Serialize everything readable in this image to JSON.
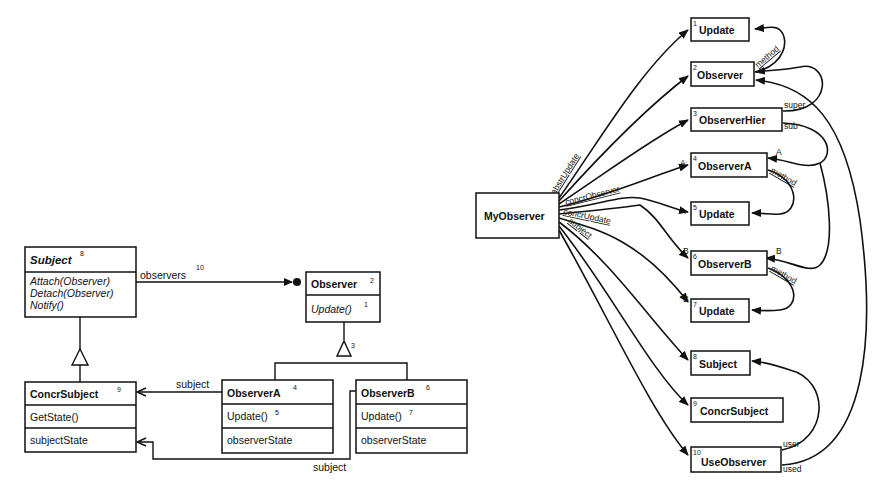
{
  "uml_diagram": {
    "classes": [
      {
        "id": "subject",
        "name": "Subject",
        "number": "8",
        "name_italic": true,
        "methods": [
          "Attach(Observer)",
          "Detach(Observer)",
          "Notify()"
        ],
        "methods_italic": true,
        "attributes": []
      },
      {
        "id": "observer",
        "name": "Observer",
        "number": "2",
        "methods": [
          "Update()"
        ],
        "method_numbers": [
          "1"
        ],
        "methods_italic": true,
        "attributes": []
      },
      {
        "id": "concr_subject",
        "name": "ConcrSubject",
        "number": "9",
        "methods": [
          "GetState()"
        ],
        "attributes": [
          "subjectState"
        ]
      },
      {
        "id": "observer_a",
        "name": "ObserverA",
        "number": "4",
        "methods": [
          "Update()"
        ],
        "method_numbers": [
          "5"
        ],
        "attributes": [
          "observerState"
        ]
      },
      {
        "id": "observer_b",
        "name": "ObserverB",
        "number": "6",
        "methods": [
          "Update()"
        ],
        "method_numbers": [
          "7"
        ],
        "attributes": [
          "observerState"
        ]
      }
    ],
    "associations": [
      {
        "from": "Subject",
        "to": "Observer",
        "label": "observers",
        "number": "10"
      },
      {
        "from": "ObserverA",
        "to": "ConcrSubject",
        "label": "subject"
      },
      {
        "from": "ObserverB",
        "to": "ConcrSubject",
        "label": "subject"
      }
    ],
    "generalizations": [
      {
        "parent": "Subject",
        "children": [
          "ConcrSubject"
        ]
      },
      {
        "parent": "Observer",
        "children": [
          "ObserverA",
          "ObserverB"
        ],
        "number": "3"
      }
    ]
  },
  "role_graph": {
    "root": "MyObserver",
    "nodes": [
      {
        "number": "1",
        "label": "Update"
      },
      {
        "number": "2",
        "label": "Observer"
      },
      {
        "number": "3",
        "label": "ObserverHier"
      },
      {
        "number": "4",
        "label": "ObserverA"
      },
      {
        "number": "5",
        "label": "Update"
      },
      {
        "number": "6",
        "label": "ObserverB"
      },
      {
        "number": "7",
        "label": "Update"
      },
      {
        "number": "8",
        "label": "Subject"
      },
      {
        "number": "9",
        "label": "ConcrSubject"
      },
      {
        "number": "10",
        "label": "UseObserver"
      }
    ],
    "edge_labels": {
      "abstr_update": "abstrUpdate",
      "concr_observer": "concrObserver",
      "concr_update": "concrUpdate",
      "subject": "subject",
      "method": "method",
      "super": "super",
      "sub": "sub",
      "a": "A",
      "b": "B",
      "user": "user",
      "used": "used"
    }
  }
}
